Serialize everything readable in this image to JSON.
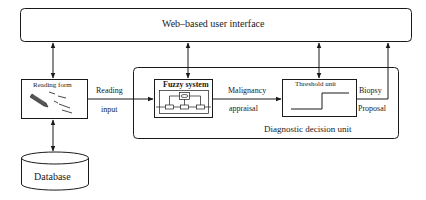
{
  "diagram": {
    "ui_box": {
      "label": "Web–based user interface"
    },
    "reading_form": {
      "label": "Reading form",
      "icon": "pencil-icon"
    },
    "database": {
      "label": "Database"
    },
    "fuzzy_system": {
      "label": "Fuzzy system"
    },
    "threshold_unit": {
      "label": "Threshold unit"
    },
    "decision_unit": {
      "label": "Diagnostic decision unit"
    },
    "edges": {
      "reading_input": {
        "line1": "Reading",
        "line2": "input"
      },
      "malignancy": {
        "line1": "Malignancy",
        "line2": "appraisal"
      },
      "biopsy": {
        "line1": "Biopsy",
        "line2": "Proposal"
      }
    },
    "colors": {
      "stroke": "#1a1a1a",
      "background": "#ffffff"
    }
  }
}
